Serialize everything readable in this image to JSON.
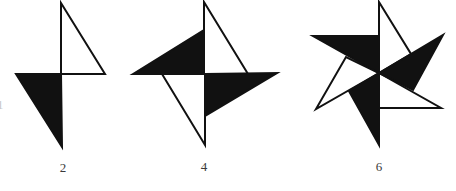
{
  "figure": {
    "colors": {
      "fill": "#111111",
      "stroke": "#111111",
      "background": "#ffffff",
      "label": "#3a3a3a"
    },
    "edge_glyph": "1",
    "panels": [
      {
        "label": "2",
        "label_pos": [
          63,
          167
        ],
        "center": [
          61,
          74
        ],
        "triangles": [
          {
            "style": "outline",
            "points": "61,3 105,74 61,74"
          },
          {
            "style": "filled",
            "points": "16,74 61,74 62,147"
          }
        ]
      },
      {
        "label": "4",
        "label_pos": [
          204,
          166
        ],
        "center": [
          204,
          74
        ],
        "triangles": [
          {
            "style": "outline",
            "points": "204,2 248,74 204,74"
          },
          {
            "style": "filled",
            "points": "133,74 204,30 204,74"
          },
          {
            "style": "filled",
            "points": "205,74 277,73 205,116"
          },
          {
            "style": "outline",
            "points": "162,74 205,145 205,74"
          }
        ]
      },
      {
        "label": "6",
        "label_pos": [
          379,
          166
        ],
        "center": [
          379,
          73
        ],
        "triangles": [
          {
            "style": "outline",
            "points": "379,2 411,54 379,73"
          },
          {
            "style": "filled",
            "points": "313,36 379,36 379,73"
          },
          {
            "style": "filled",
            "points": "379,73 443,35 413,90"
          },
          {
            "style": "outline",
            "points": "379,73 441,108 379,108"
          },
          {
            "style": "outline",
            "points": "379,73 316,109 346,57"
          },
          {
            "style": "filled",
            "points": "379,73 349,91 379,145"
          }
        ]
      }
    ]
  }
}
